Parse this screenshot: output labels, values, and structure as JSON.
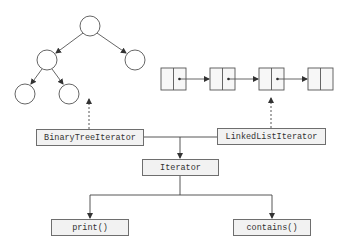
{
  "diagram": {
    "boxes": {
      "binary_tree_iterator": "BinaryTreeIterator",
      "linked_list_iterator": "LinkedListIterator",
      "iterator": "Iterator",
      "print": "print()",
      "contains": "contains()"
    },
    "binary_tree": {
      "nodes": 5,
      "edges": [
        [
          "root",
          "left"
        ],
        [
          "root",
          "right"
        ],
        [
          "left",
          "left-left"
        ],
        [
          "left",
          "left-right"
        ]
      ]
    },
    "linked_list": {
      "nodes": 4
    },
    "colors": {
      "line": "#444444",
      "box_fill": "#f2f2f2",
      "box_border": "#6e6e6e"
    }
  }
}
